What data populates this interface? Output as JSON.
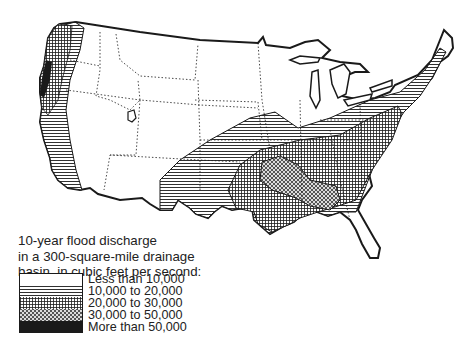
{
  "map": {
    "title": "10-year flood discharge in a 300-square-mile drainage basin",
    "region": "Contiguous United States",
    "colors": {
      "ink": "#1a1a1a",
      "paper": "#ffffff"
    }
  },
  "legend": {
    "title_lines": [
      "10-year flood discharge",
      "in a 300-square-mile drainage",
      "basin, in cubic feet per second:"
    ],
    "items": [
      {
        "label": "Less than 10,000",
        "pattern": "blank"
      },
      {
        "label": "10,000 to 20,000",
        "pattern": "horizontal-lines"
      },
      {
        "label": "20,000 to 30,000",
        "pattern": "crosshatch-grid"
      },
      {
        "label": "30,000 to 50,000",
        "pattern": "diagonal-hatch"
      },
      {
        "label": "More than 50,000",
        "pattern": "solid-black"
      }
    ]
  }
}
